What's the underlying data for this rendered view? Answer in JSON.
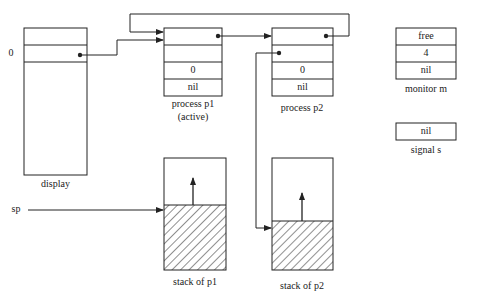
{
  "display": {
    "label": "display",
    "index_label": "0"
  },
  "process_p1": {
    "label": "process p1",
    "sublabel": "(active)",
    "cells": [
      "",
      "",
      "0",
      "nil"
    ]
  },
  "process_p2": {
    "label": "process p2",
    "cells": [
      "",
      "",
      "0",
      "nil"
    ]
  },
  "monitor_m": {
    "label": "monitor m",
    "cells": [
      "free",
      "4",
      "nil"
    ]
  },
  "signal_s": {
    "label": "signal s",
    "cells": [
      "nil"
    ]
  },
  "stack_p1": {
    "label": "stack of p1",
    "pointer_label": "sp"
  },
  "stack_p2": {
    "label": "stack of p2"
  },
  "colors": {
    "ink": "#222222",
    "background": "#ffffff"
  }
}
